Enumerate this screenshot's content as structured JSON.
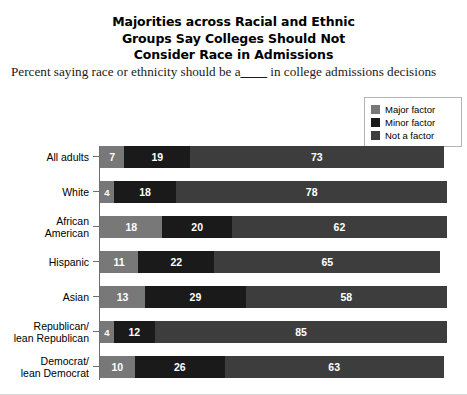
{
  "title": {
    "lines": [
      "Majorities across Racial and Ethnic",
      "Groups Say Colleges Should Not",
      "Consider Race in Admissions"
    ]
  },
  "subtitle": {
    "before": "Percent saying race or ethnicity should be a",
    "blank": "____",
    "after": " in college admissions decisions"
  },
  "legend": {
    "items": [
      {
        "label": "Major factor",
        "color": "#787878"
      },
      {
        "label": "Minor factor",
        "color": "#1a1a1a"
      },
      {
        "label": "Not a factor",
        "color": "#3d3d3d"
      }
    ]
  },
  "chart_data": {
    "type": "bar",
    "orientation": "horizontal",
    "stacked": true,
    "title": "Majorities across Racial and Ethnic Groups Say Colleges Should Not Consider Race in Admissions",
    "subtitle": "Percent saying race or ethnicity should be a____ in college admissions decisions",
    "xlabel": "",
    "ylabel": "",
    "xlim": [
      0,
      100
    ],
    "grid": false,
    "legend_position": "top-right",
    "categories": [
      "All adults",
      "White",
      "African American",
      "Hispanic",
      "Asian",
      "Republican/lean Republican",
      "Democrat/lean Democrat"
    ],
    "series": [
      {
        "name": "Major factor",
        "color": "#787878",
        "values": [
          7,
          4,
          18,
          11,
          13,
          4,
          10
        ]
      },
      {
        "name": "Minor factor",
        "color": "#1a1a1a",
        "values": [
          19,
          18,
          20,
          22,
          29,
          12,
          26
        ]
      },
      {
        "name": "Not a factor",
        "color": "#3d3d3d",
        "values": [
          73,
          78,
          62,
          65,
          58,
          85,
          63
        ]
      }
    ],
    "rows": [
      {
        "label_lines": [
          "All adults"
        ],
        "major": 7,
        "minor": 19,
        "not": 73
      },
      {
        "label_lines": [
          "White"
        ],
        "major": 4,
        "minor": 18,
        "not": 78
      },
      {
        "label_lines": [
          "African",
          "American"
        ],
        "major": 18,
        "minor": 20,
        "not": 62
      },
      {
        "label_lines": [
          "Hispanic"
        ],
        "major": 11,
        "minor": 22,
        "not": 65
      },
      {
        "label_lines": [
          "Asian"
        ],
        "major": 13,
        "minor": 29,
        "not": 58
      },
      {
        "label_lines": [
          "Republican/",
          "lean Republican"
        ],
        "major": 4,
        "minor": 12,
        "not": 85
      },
      {
        "label_lines": [
          "Democrat/",
          "lean Democrat"
        ],
        "major": 10,
        "minor": 26,
        "not": 63
      }
    ]
  }
}
